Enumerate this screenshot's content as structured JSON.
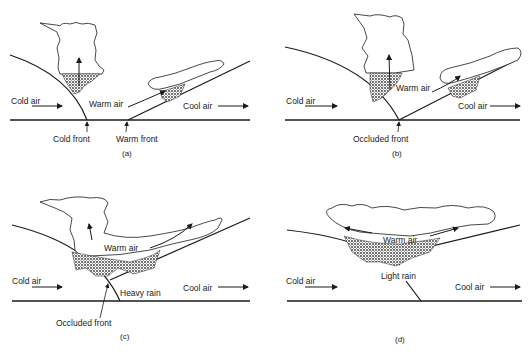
{
  "figure": {
    "panels": [
      {
        "id": "a",
        "caption": "(a)",
        "labels": {
          "left_air": "Cold air",
          "center_air": "Warm air",
          "right_air": "Cool air",
          "front_1": "Cold front",
          "front_2": "Warm front"
        }
      },
      {
        "id": "b",
        "caption": "(b)",
        "labels": {
          "left_air": "Cold air",
          "center_air": "Warm air",
          "right_air": "Cool air",
          "front": "Occluded front"
        }
      },
      {
        "id": "c",
        "caption": "(c)",
        "labels": {
          "left_air": "Cold air",
          "center_air": "Warm air",
          "right_air": "Cool air",
          "rain": "Heavy rain",
          "front": "Occluded front"
        }
      },
      {
        "id": "d",
        "caption": "(d)",
        "labels": {
          "left_air": "Cold air",
          "center_air": "Warm air",
          "right_air": "Cool air",
          "rain": "Light rain"
        }
      }
    ]
  },
  "colors": {
    "ink": "#1a1a1a",
    "background": "#ffffff",
    "rain_shade": "#555555"
  }
}
